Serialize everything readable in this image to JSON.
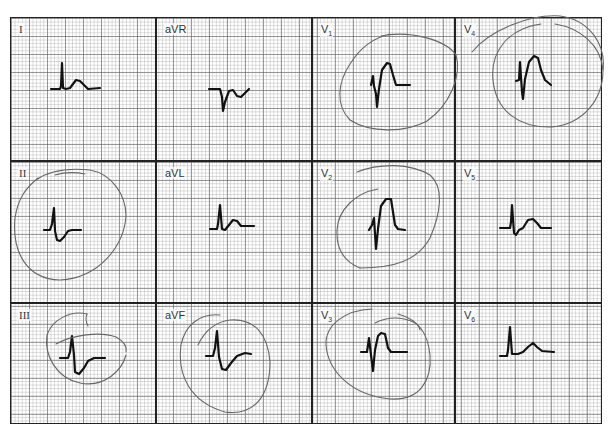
{
  "figure": {
    "type": "12-lead ECG, 3x4 layout with hand-drawn circles",
    "grid_color": "#8c8c8c",
    "trace_color": "#111111",
    "annotation_color": "#555555"
  },
  "leads": [
    {
      "id": "I",
      "label": "I",
      "sub": "",
      "row": 0,
      "col": 0,
      "circled": false
    },
    {
      "id": "aVR",
      "label": "aVR",
      "sub": "",
      "row": 0,
      "col": 1,
      "circled": false
    },
    {
      "id": "V1",
      "label": "V",
      "sub": "1",
      "row": 0,
      "col": 2,
      "circled": true
    },
    {
      "id": "V4",
      "label": "V",
      "sub": "4",
      "row": 0,
      "col": 3,
      "circled": true
    },
    {
      "id": "II",
      "label": "II",
      "sub": "",
      "row": 1,
      "col": 0,
      "circled": true
    },
    {
      "id": "aVL",
      "label": "aVL",
      "sub": "",
      "row": 1,
      "col": 1,
      "circled": false
    },
    {
      "id": "V2",
      "label": "V",
      "sub": "2",
      "row": 1,
      "col": 2,
      "circled": true
    },
    {
      "id": "V5",
      "label": "V",
      "sub": "5",
      "row": 1,
      "col": 3,
      "circled": false
    },
    {
      "id": "III",
      "label": "III",
      "sub": "",
      "row": 2,
      "col": 0,
      "circled": true
    },
    {
      "id": "aVF",
      "label": "aVF",
      "sub": "",
      "row": 2,
      "col": 1,
      "circled": true
    },
    {
      "id": "V3",
      "label": "V",
      "sub": "3",
      "row": 2,
      "col": 2,
      "circled": true
    },
    {
      "id": "V6",
      "label": "V",
      "sub": "6",
      "row": 2,
      "col": 3,
      "circled": false
    }
  ]
}
